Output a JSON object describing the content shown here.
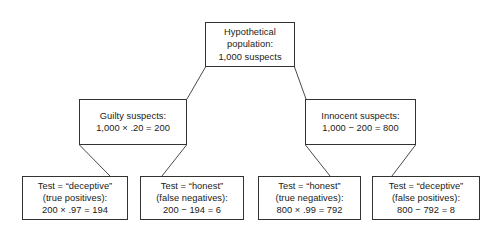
{
  "diagram": {
    "type": "tree",
    "orientation": "top-down",
    "levels": 3,
    "background_color": "#ffffff",
    "box_border_color": "#33332f",
    "connector_color": "#4a4a46",
    "text_color": "#1a1a18"
  },
  "nodes": {
    "root": {
      "id": "root",
      "lines": [
        "Hypothetical",
        "population:",
        "1,000 suspects"
      ]
    },
    "guilty": {
      "id": "guilty",
      "lines": [
        "Guilty suspects:",
        "1,000 × .20 = 200"
      ]
    },
    "innocent": {
      "id": "innocent",
      "lines": [
        "Innocent suspects:",
        "1,000 − 200 = 800"
      ]
    },
    "true_positives": {
      "id": "true_positives",
      "lines": [
        "Test = “deceptive”",
        "(true positives):",
        "200 × .97 = 194"
      ]
    },
    "false_negatives": {
      "id": "false_negatives",
      "lines": [
        "Test = “honest”",
        "(false negatives):",
        "200 − 194 = 6"
      ]
    },
    "true_negatives": {
      "id": "true_negatives",
      "lines": [
        "Test = “honest”",
        "(true negatives):",
        "800 × .99 = 792"
      ]
    },
    "false_positives": {
      "id": "false_positives",
      "lines": [
        "Test = “deceptive”",
        "(false positives):",
        "800 − 792 = 8"
      ]
    }
  },
  "edges": [
    {
      "from": "root",
      "to": "guilty"
    },
    {
      "from": "root",
      "to": "innocent"
    },
    {
      "from": "guilty",
      "to": "true_positives"
    },
    {
      "from": "guilty",
      "to": "false_negatives"
    },
    {
      "from": "innocent",
      "to": "true_negatives"
    },
    {
      "from": "innocent",
      "to": "false_positives"
    }
  ]
}
